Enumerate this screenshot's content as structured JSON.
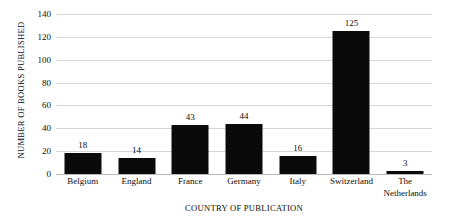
{
  "chart_data": {
    "type": "bar",
    "title": "",
    "xlabel": "COUNTRY OF PUBLICATION",
    "ylabel": "NUMBER OF BOOKS PUBLISHED",
    "categories": [
      "Belgium",
      "England",
      "France",
      "Germany",
      "Italy",
      "Switzerland",
      "The\nNetherlands"
    ],
    "values": [
      18,
      14,
      43,
      44,
      16,
      125,
      3
    ],
    "data_labels": [
      "18",
      "14",
      "43",
      "44",
      "16",
      "125",
      "3"
    ],
    "ylim": [
      0,
      140
    ],
    "y_ticks": [
      0,
      20,
      40,
      60,
      80,
      100,
      120,
      140
    ],
    "y_tick_labels": [
      "0",
      "20",
      "40",
      "60",
      "80",
      "100",
      "120",
      "140"
    ],
    "grid": true,
    "grid_axis": "y",
    "legend": false,
    "legend_position": "none",
    "bar_color": "#0a0a0a",
    "grid_color": "#d6d6d6",
    "background_color": "#ffffff",
    "text_color": "#0d0d0d"
  }
}
